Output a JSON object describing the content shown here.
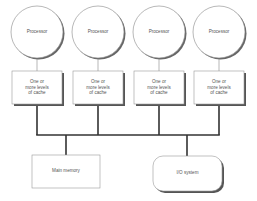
{
  "diagram": {
    "title": "",
    "processors": [
      {
        "label": "Processor",
        "cx": 37,
        "cy": 32
      },
      {
        "label": "Processor",
        "cx": 98,
        "cy": 32
      },
      {
        "label": "Processor",
        "cx": 159,
        "cy": 32
      },
      {
        "label": "Processor",
        "cx": 219,
        "cy": 32
      }
    ],
    "caches": [
      {
        "line1": "One or",
        "line2": "more levels",
        "line3": "of cache",
        "x": 12
      },
      {
        "line1": "One or",
        "line2": "more levels",
        "line3": "of cache",
        "x": 73
      },
      {
        "line1": "One or",
        "line2": "more levels",
        "line3": "of cache",
        "x": 134
      },
      {
        "line1": "One or",
        "line2": "more levels",
        "line3": "of cache",
        "x": 194
      }
    ],
    "main_memory": {
      "label": "Main memory"
    },
    "io_system": {
      "label": "I/O system"
    },
    "colors": {
      "stroke": "#777777",
      "bus": "#333333",
      "shadow": "#555555",
      "fill": "#ffffff"
    }
  }
}
